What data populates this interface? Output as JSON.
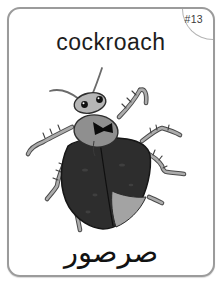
{
  "card": {
    "number_label": "#13",
    "title": "cockroach",
    "translation_arabic": "صرصور"
  },
  "colors": {
    "card_border": "#9b9b9b",
    "number_text": "#3c3c3c",
    "title_text": "#1d1d1d",
    "translation_text": "#121212",
    "bug_body": "#2d2d2d",
    "bug_pronotum": "#8f8f8f",
    "bug_head": "#b6b6b6",
    "bug_legs": "#acacac",
    "bug_leg_outline": "#4a4a4a",
    "bug_abdomen_tip": "#a3a3a3",
    "bug_marking": "#0b0b0b"
  },
  "illustration": {
    "icon": "cockroach-illustration"
  }
}
